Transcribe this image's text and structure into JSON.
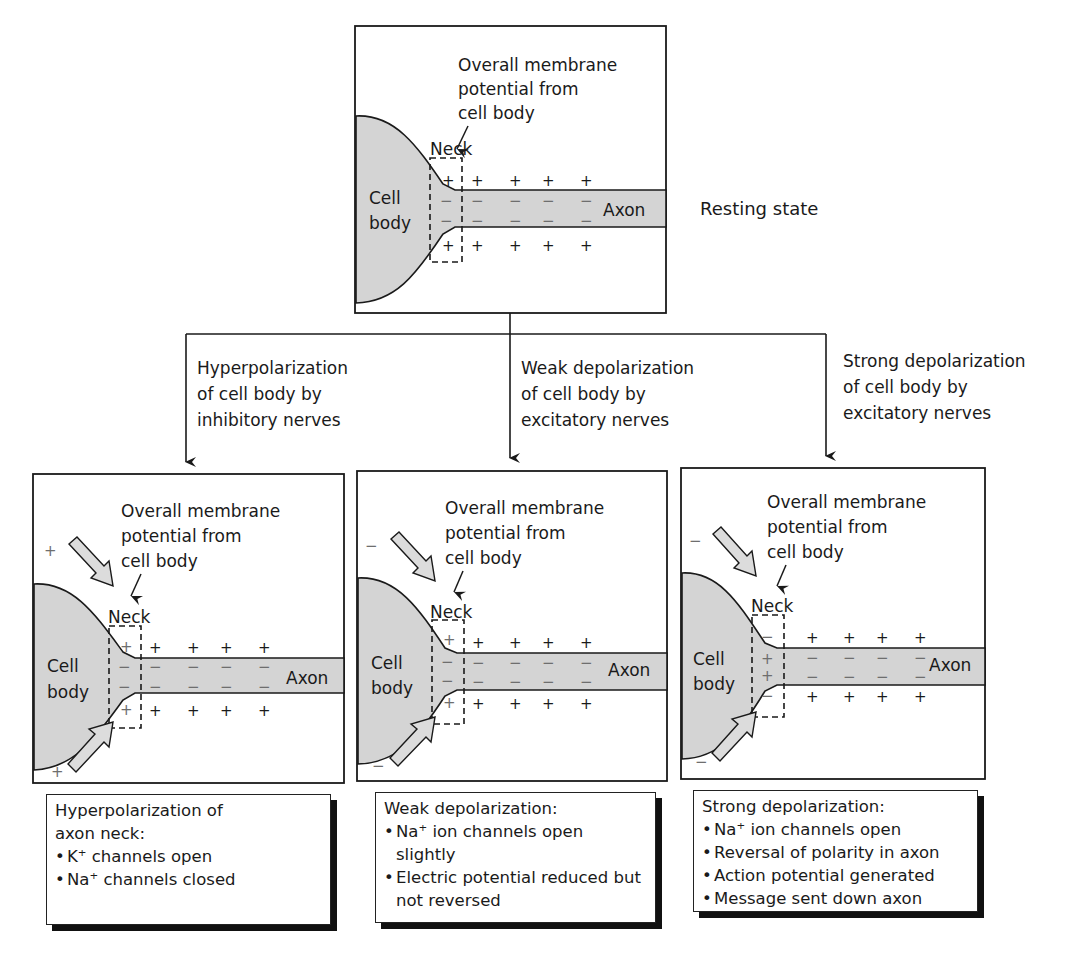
{
  "top_panel": {
    "caption": "Overall membrane potential from cell body",
    "caption_lines": [
      "Overall membrane",
      "potential from",
      "cell body"
    ],
    "neck_label": "Neck",
    "cell_body_lines": [
      "Cell",
      "body"
    ],
    "axon_label": "Axon",
    "state_label": "Resting state",
    "neck_outer_signs": [
      "+",
      "+"
    ],
    "neck_inner_signs": [
      "−",
      "−"
    ]
  },
  "branches": [
    {
      "condition_lines": [
        "Hyperpolarization",
        "of cell body by",
        "inhibitory nerves"
      ],
      "panel": {
        "caption_lines": [
          "Overall membrane",
          "potential from",
          "cell body"
        ],
        "neck_label": "Neck",
        "cell_body_lines": [
          "Cell",
          "body"
        ],
        "axon_label": "Axon",
        "input_sign": "+",
        "neck_outer_signs": [
          "+",
          "+"
        ],
        "neck_inner_signs": [
          "−",
          "−"
        ]
      },
      "result": {
        "title": "Hyperpolarization of axon neck:",
        "title_lines": [
          "Hyperpolarization of",
          "axon neck:"
        ],
        "bullets": [
          "K⁺ channels open",
          "Na⁺ channels closed"
        ]
      }
    },
    {
      "condition_lines": [
        "Weak depolarization",
        "of cell body by",
        "excitatory nerves"
      ],
      "panel": {
        "caption_lines": [
          "Overall membrane",
          "potential from",
          "cell body"
        ],
        "neck_label": "Neck",
        "cell_body_lines": [
          "Cell",
          "body"
        ],
        "axon_label": "Axon",
        "input_sign": "−",
        "neck_outer_signs": [
          "+",
          "+"
        ],
        "neck_inner_signs": [
          "−",
          "−"
        ]
      },
      "result": {
        "title": "Weak depolarization:",
        "title_lines": [
          "Weak depolarization:"
        ],
        "bullets": [
          "Na⁺ ion channels open slightly",
          "Electric potential reduced but not reversed"
        ]
      }
    },
    {
      "condition_lines": [
        "Strong depolarization",
        "of cell body by",
        "excitatory nerves"
      ],
      "panel": {
        "caption_lines": [
          "Overall membrane",
          "potential from",
          "cell body"
        ],
        "neck_label": "Neck",
        "cell_body_lines": [
          "Cell",
          "body"
        ],
        "axon_label": "Axon",
        "input_sign": "−",
        "neck_outer_signs": [
          "−",
          "−"
        ],
        "neck_inner_signs": [
          "+",
          "+"
        ]
      },
      "result": {
        "title": "Strong depolarization:",
        "title_lines": [
          "Strong depolarization:"
        ],
        "bullets": [
          "Na⁺ ion channels open",
          "Reversal of polarity in axon",
          "Action potential generated",
          "Message sent down axon"
        ]
      }
    }
  ],
  "axon_outer_sign": "+",
  "axon_inner_sign": "−",
  "colors": {
    "cell_fill": "#d4d4d4",
    "stroke": "#1a1a1a",
    "arrow_fill": "#dcdcdc",
    "shadow": "#111111"
  }
}
